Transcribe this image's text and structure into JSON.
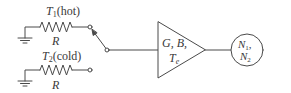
{
  "diagram": {
    "hot_source": {
      "temperature_label_var": "T",
      "temperature_label_sub": "1",
      "temperature_label_suffix": "(hot)",
      "resistor_label": "R"
    },
    "cold_source": {
      "temperature_label_var": "T",
      "temperature_label_sub": "2",
      "temperature_label_suffix": "(cold)",
      "resistor_label": "R"
    },
    "switch": {
      "position": "hot"
    },
    "amplifier": {
      "line1": "G, B,",
      "line2_var": "T",
      "line2_sub": "e"
    },
    "output_meter": {
      "line1_var": "N",
      "line1_sub": "1",
      "line1_suffix": ",",
      "line2_var": "N",
      "line2_sub": "2"
    },
    "colors": {
      "stroke": "#4a4a4a",
      "background": "#ffffff"
    }
  }
}
